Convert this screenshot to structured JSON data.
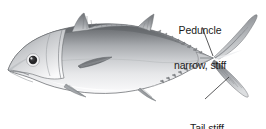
{
  "figure": {
    "background_color": "#ffffff",
    "width": 266,
    "height": 129
  },
  "annotations": [
    {
      "id": "peduncle",
      "line1": "Peduncle",
      "line2": "narrow, stiff",
      "text_color": "#1b1b1b",
      "leader_from": [
        202,
        27
      ],
      "leader_to": [
        213,
        56
      ]
    },
    {
      "id": "tail",
      "line1": "Tail stiff",
      "text_color": "#1b1b1b",
      "leader_from": [
        205,
        99
      ],
      "leader_to": [
        229,
        77
      ]
    }
  ],
  "illustration": {
    "style": "pencil-grayscale-scientific-drawing",
    "colors": {
      "dorsal_dark": "#6f7276",
      "dorsal_mid": "#9a9da1",
      "flank_light": "#d8dadc",
      "belly_white": "#fbfbfc",
      "outline": "#5d6064",
      "fin_dark": "#6a6d71",
      "fin_mid": "#9b9ea2",
      "eye_pupil": "#2b2b2d",
      "eye_ring": "#f2f2f3",
      "leader_line": "#2e2e30"
    },
    "parts": [
      {
        "name": "body",
        "label": "fusiform streamlined body"
      },
      {
        "name": "head",
        "label": "pointed head with large eye"
      },
      {
        "name": "eye",
        "center": [
          33,
          60
        ],
        "radius": 5
      },
      {
        "name": "mouth",
        "label": "terminal mouth at snout"
      },
      {
        "name": "operculum",
        "label": "gill cover arc"
      },
      {
        "name": "first-dorsal-fin",
        "label": "spiny first dorsal fin"
      },
      {
        "name": "second-dorsal-fin",
        "label": "pointed second dorsal fin"
      },
      {
        "name": "pectoral-fin",
        "label": "narrow dark pectoral blade"
      },
      {
        "name": "pelvic-fin",
        "label": "small pelvic fin"
      },
      {
        "name": "anal-fin",
        "label": "pointed anal fin"
      },
      {
        "name": "dorsal-finlets",
        "label": "row of small dorsal finlets"
      },
      {
        "name": "ventral-finlets",
        "label": "row of small ventral finlets"
      },
      {
        "name": "caudal-peduncle",
        "label": "narrow stiff caudal peduncle with keel"
      },
      {
        "name": "caudal-fin",
        "label": "deeply forked lunate tail"
      }
    ]
  }
}
